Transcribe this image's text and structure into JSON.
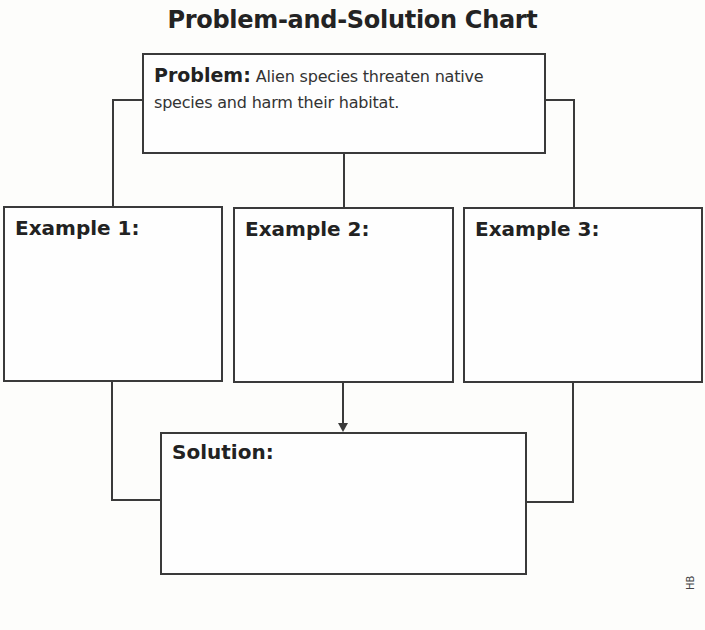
{
  "title": "Problem-and-Solution Chart",
  "problem": {
    "label": "Problem:",
    "text": "Alien species threaten native species and harm their habitat."
  },
  "examples": [
    {
      "label": "Example 1:",
      "text": ""
    },
    {
      "label": "Example 2:",
      "text": ""
    },
    {
      "label": "Example 3:",
      "text": ""
    }
  ],
  "solution": {
    "label": "Solution:",
    "text": ""
  },
  "footer": {
    "code": "HB"
  },
  "colors": {
    "line": "#3a3a3a",
    "text": "#222222"
  }
}
